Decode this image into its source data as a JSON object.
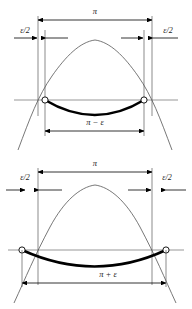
{
  "figure": {
    "title": "",
    "background_color": "#ffffff",
    "curve_color": "#555555",
    "arc_color": "#000000",
    "guide_color": "#6b6b6b",
    "panels": [
      {
        "name": "upper-diagram",
        "labels": {
          "span_top": "π",
          "epsilon_left": "ε/2",
          "epsilon_right": "ε/2",
          "span_bottom": "π − ε"
        },
        "geometry": {
          "axis_y": 100,
          "outer_left_x": 38,
          "outer_right_x": 152,
          "inner_left_x": 45,
          "inner_right_x": 144,
          "apex_x": 95,
          "apex_y": 40,
          "arc_depth": 17,
          "top_dim_y": 20,
          "eps_dim_y": 38,
          "bottom_dim_y": 131
        },
        "markers": [
          {
            "name": "left-intersection-point",
            "x": 45,
            "y": 100
          },
          {
            "name": "right-intersection-point",
            "x": 144,
            "y": 100
          }
        ]
      },
      {
        "name": "lower-diagram",
        "labels": {
          "span_top": "π",
          "epsilon_left": "ε/2",
          "epsilon_right": "ε/2",
          "span_bottom": "π + ε"
        },
        "geometry": {
          "axis_y": 95,
          "outer_left_x": 38,
          "outer_right_x": 152,
          "inner_left_x": 22,
          "inner_right_x": 166,
          "apex_x": 95,
          "apex_y": 30,
          "arc_depth": 19,
          "top_dim_y": 17,
          "eps_dim_y": 35,
          "bottom_dim_y": 128
        },
        "markers": [
          {
            "name": "left-intersection-point",
            "x": 22,
            "y": 95
          },
          {
            "name": "right-intersection-point",
            "x": 166,
            "y": 95
          }
        ]
      }
    ]
  }
}
